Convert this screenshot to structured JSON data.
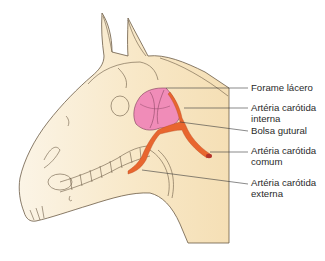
{
  "diagram": {
    "labels": [
      {
        "id": "forame-lacero",
        "lines": [
          "Forame lácero"
        ]
      },
      {
        "id": "arteria-carotida-interna",
        "lines": [
          "Artéria carótida",
          "interna"
        ]
      },
      {
        "id": "bolsa-gutural",
        "lines": [
          "Bolsa gutural"
        ]
      },
      {
        "id": "arteria-carotida-comum",
        "lines": [
          "Artéria carótida",
          "comum"
        ]
      },
      {
        "id": "arteria-carotida-externa",
        "lines": [
          "Artéria carótida",
          "externa"
        ]
      }
    ],
    "colors": {
      "head_fill": "#f6e2bc",
      "head_fill_light": "#fbf3e2",
      "outline": "#6b5a45",
      "pouch_fill": "#f08cb8",
      "pouch_outline": "#7a3a55",
      "artery_fill": "#e8662f",
      "artery_end": "#b5332a",
      "leader_line": "#3a3a3a"
    }
  }
}
